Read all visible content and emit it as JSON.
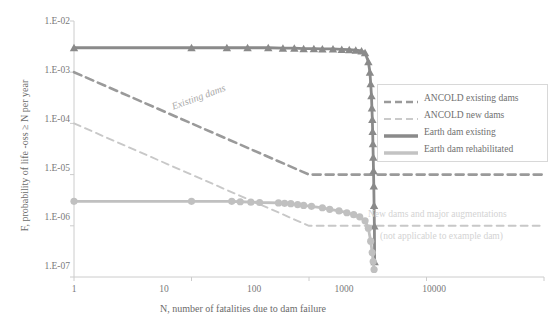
{
  "chart_data": {
    "type": "line",
    "title": "",
    "xlabel": "N, number of fatalities due to dam failure",
    "ylabel": "F, probability of life -oss ≥ N per year",
    "xscale": "log",
    "yscale": "log",
    "xlim": [
      1,
      10000
    ],
    "ylim": [
      1e-07,
      0.01
    ],
    "xticks": [
      "1",
      "10",
      "100",
      "1000",
      "10000"
    ],
    "xtick_values": [
      1,
      10,
      100,
      1000,
      10000
    ],
    "yticks": [
      "1.E-02",
      "1.E-03",
      "1.E-04",
      "1.E-05",
      "1.E-06",
      "1.E-07"
    ],
    "ytick_values": [
      0.01,
      0.001,
      0.0001,
      1e-05,
      1e-06,
      1e-07
    ],
    "grid": false,
    "legend_position": "right",
    "series": [
      {
        "name": "ANCOLD existing dams",
        "style": "dashed",
        "color": "#9a9a9a",
        "marker": "none",
        "points": [
          [
            1,
            0.001
          ],
          [
            100,
            1e-05
          ],
          [
            10000,
            1e-05
          ]
        ]
      },
      {
        "name": "ANCOLD new dams",
        "style": "dashed",
        "color": "#c8c8c8",
        "marker": "none",
        "points": [
          [
            1,
            0.0001
          ],
          [
            100,
            1e-06
          ],
          [
            10000,
            1e-06
          ]
        ]
      },
      {
        "name": "Earth dam existing",
        "style": "solid",
        "color": "#8a8a8a",
        "marker": "triangle",
        "points": [
          [
            1,
            0.003
          ],
          [
            10,
            0.003
          ],
          [
            20,
            0.003
          ],
          [
            30,
            0.003
          ],
          [
            45,
            0.003
          ],
          [
            60,
            0.00295
          ],
          [
            75,
            0.00295
          ],
          [
            90,
            0.0029
          ],
          [
            110,
            0.0029
          ],
          [
            130,
            0.00285
          ],
          [
            160,
            0.00285
          ],
          [
            190,
            0.0028
          ],
          [
            220,
            0.00275
          ],
          [
            250,
            0.0027
          ],
          [
            280,
            0.0026
          ],
          [
            300,
            0.0024
          ],
          [
            320,
            0.0016
          ],
          [
            330,
            0.001
          ],
          [
            335,
            0.0006
          ],
          [
            340,
            0.00035
          ],
          [
            343,
            0.0002
          ],
          [
            346,
            0.00012
          ],
          [
            348,
            7e-05
          ],
          [
            350,
            4e-05
          ],
          [
            352,
            2.2e-05
          ],
          [
            354,
            1.2e-05
          ],
          [
            356,
            6e-06
          ],
          [
            358,
            2.5e-06
          ],
          [
            360,
            1e-06
          ],
          [
            362,
            2e-07
          ]
        ]
      },
      {
        "name": "Earth dam rehabilitated",
        "style": "solid",
        "color": "#c0c0c0",
        "marker": "circle",
        "points": [
          [
            1,
            3e-06
          ],
          [
            10,
            3e-06
          ],
          [
            22,
            3e-06
          ],
          [
            26,
            2.95e-06
          ],
          [
            32,
            2.9e-06
          ],
          [
            38,
            2.85e-06
          ],
          [
            55,
            2.8e-06
          ],
          [
            62,
            2.75e-06
          ],
          [
            70,
            2.7e-06
          ],
          [
            80,
            2.6e-06
          ],
          [
            90,
            2.5e-06
          ],
          [
            105,
            2.4e-06
          ],
          [
            130,
            2.25e-06
          ],
          [
            150,
            2.1e-06
          ],
          [
            180,
            1.95e-06
          ],
          [
            210,
            1.8e-06
          ],
          [
            240,
            1.65e-06
          ],
          [
            270,
            1.5e-06
          ],
          [
            300,
            1.25e-06
          ],
          [
            320,
            9e-07
          ],
          [
            335,
            5e-07
          ],
          [
            345,
            3e-07
          ],
          [
            352,
            2e-07
          ],
          [
            358,
            1.4e-07
          ]
        ]
      }
    ],
    "annotations": [
      {
        "text": "Existing dams",
        "x": 12,
        "y": 0.0002,
        "rotation": -20
      },
      {
        "text": "New dams and major augmentations",
        "x": 900,
        "y": 2.4e-06
      },
      {
        "text": "(not applicable to example dam)",
        "x": 1100,
        "y": 9e-07
      }
    ]
  },
  "legend": {
    "items": [
      {
        "label": "ANCOLD existing dams",
        "key": "dashed-thick-grey"
      },
      {
        "label": "ANCOLD new dams",
        "key": "dashed-thin-lightgrey"
      },
      {
        "label": "Earth dam existing",
        "key": "solid-thick-grey"
      },
      {
        "label": "Earth dam rehabilitated",
        "key": "solid-thick-lightgrey"
      }
    ]
  },
  "colors": {
    "ancold_existing": "#9a9a9a",
    "ancold_new": "#c8c8c8",
    "earth_existing": "#8a8a8a",
    "earth_rehab": "#c0c0c0",
    "axis": "#cccccc",
    "text": "#6f6f6f",
    "annotation": "#d3d3d3"
  }
}
